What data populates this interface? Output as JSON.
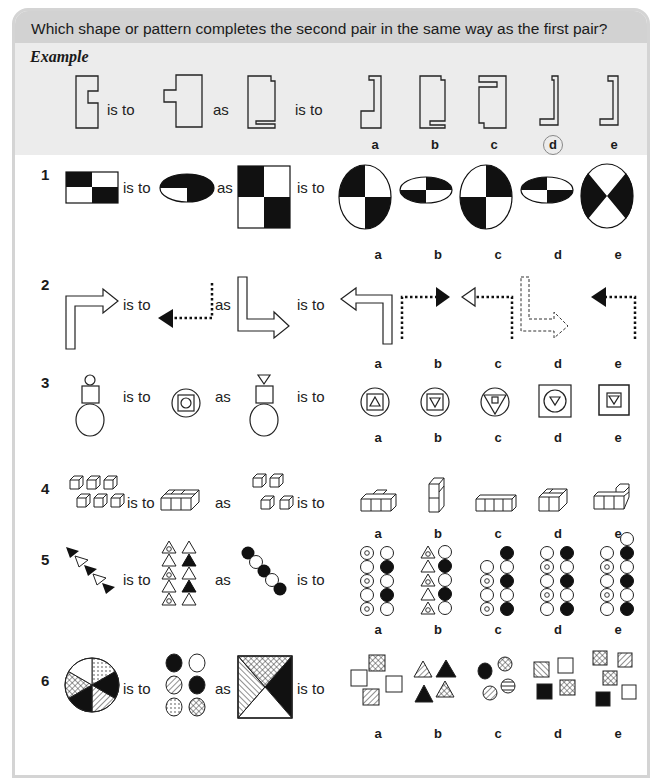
{
  "header": {
    "instruction": "Which shape or pattern completes the second pair in the same way as the first pair?"
  },
  "words": {
    "is_to": "is to",
    "as": "as"
  },
  "example": {
    "label": "Example",
    "options": [
      "a",
      "b",
      "c",
      "d",
      "e"
    ],
    "circled_answer": "d"
  },
  "questions": [
    {
      "number": "1",
      "options": [
        "a",
        "b",
        "c",
        "d",
        "e"
      ],
      "description": "Black/white quartered rectangle becomes quartered ellipse; large quartered square to circle"
    },
    {
      "number": "2",
      "options": [
        "a",
        "b",
        "c",
        "d",
        "e"
      ],
      "description": "Outlined bent arrow becomes dotted line with black arrowhead reversed"
    },
    {
      "number": "3",
      "options": [
        "a",
        "b",
        "c",
        "d",
        "e"
      ],
      "description": "Stacked shapes nested concentrically"
    },
    {
      "number": "4",
      "options": [
        "a",
        "b",
        "c",
        "d",
        "e"
      ],
      "description": "Separate cubes joined into a block"
    },
    {
      "number": "5",
      "options": [
        "a",
        "b",
        "c",
        "d",
        "e"
      ],
      "description": "Diagonal chain of triangles rearranged into two columns"
    },
    {
      "number": "6",
      "options": [
        "a",
        "b",
        "c",
        "d",
        "e"
      ],
      "description": "Patterned segments separated into individual shapes"
    }
  ],
  "colors": {
    "header_bg": "#d2d2d2",
    "example_bg": "#ececec",
    "frame_border": "#d4d4d4",
    "ink": "#1a1a1a"
  }
}
